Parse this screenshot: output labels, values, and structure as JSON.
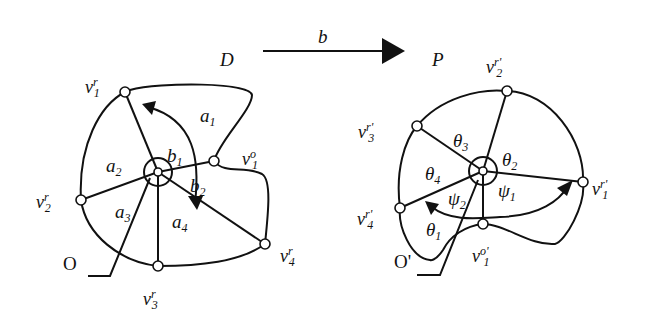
{
  "figure": {
    "transform_arrow": {
      "label": "b"
    },
    "left": {
      "region_label": "D",
      "origin_label": "O",
      "vertices": {
        "v1r": {
          "base": "v",
          "sup": "r",
          "sub": "1"
        },
        "v1o": {
          "base": "v",
          "sup": "o",
          "sub": "1"
        },
        "v2r": {
          "base": "v",
          "sup": "r",
          "sub": "2"
        },
        "v3r": {
          "base": "v",
          "sup": "r",
          "sub": "3"
        },
        "v4r": {
          "base": "v",
          "sup": "r",
          "sub": "4"
        }
      },
      "angles": {
        "a1": {
          "base": "a",
          "sub": "1"
        },
        "a2": {
          "base": "a",
          "sub": "2"
        },
        "a3": {
          "base": "a",
          "sub": "3"
        },
        "a4": {
          "base": "a",
          "sub": "4"
        },
        "b1": {
          "base": "b",
          "sub": "1"
        },
        "b2": {
          "base": "b",
          "sub": "2"
        }
      }
    },
    "right": {
      "region_label": "P",
      "origin_label": "O'",
      "vertices": {
        "v1r": {
          "base": "v",
          "sup": "r'",
          "sub": "1"
        },
        "v1o": {
          "base": "v",
          "sup": "o'",
          "sub": "1"
        },
        "v2r": {
          "base": "v",
          "sup": "r'",
          "sub": "2"
        },
        "v3r": {
          "base": "v",
          "sup": "r'",
          "sub": "3"
        },
        "v4r": {
          "base": "v",
          "sup": "r'",
          "sub": "4"
        }
      },
      "angles": {
        "t1": {
          "base": "θ",
          "sub": "1"
        },
        "t2": {
          "base": "θ",
          "sub": "2"
        },
        "t3": {
          "base": "θ",
          "sub": "3"
        },
        "t4": {
          "base": "θ",
          "sub": "4"
        },
        "p1": {
          "base": "ψ",
          "sub": "1"
        },
        "p2": {
          "base": "ψ",
          "sub": "2"
        }
      }
    }
  }
}
